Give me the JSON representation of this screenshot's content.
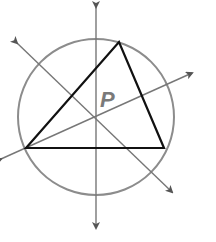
{
  "diagram": {
    "point_label": "P",
    "colors": {
      "circle": "#8c8c8c",
      "bisector": "#777777",
      "triangle": "#111111",
      "label": "#7a7a7a",
      "background": "#ffffff"
    },
    "circle": {
      "cx": 96,
      "cy": 117,
      "r": 78
    },
    "triangle": {
      "vertices": [
        {
          "name": "A",
          "x": 26,
          "y": 148
        },
        {
          "name": "B",
          "x": 119,
          "y": 42
        },
        {
          "name": "C",
          "x": 164,
          "y": 148
        }
      ]
    },
    "center": {
      "x": 96,
      "y": 117
    },
    "bisectors": [
      {
        "name": "vertical-bisector",
        "x1": 96,
        "y1": 7,
        "x2": 96,
        "y2": 228
      },
      {
        "name": "diagonal-bisector-ab",
        "x1": 17,
        "y1": 43,
        "x2": 172,
        "y2": 192
      },
      {
        "name": "diagonal-bisector-bc",
        "x1": 1,
        "y1": 159,
        "x2": 192,
        "y2": 73
      }
    ],
    "label_position": {
      "x": 100,
      "y": 107
    }
  }
}
